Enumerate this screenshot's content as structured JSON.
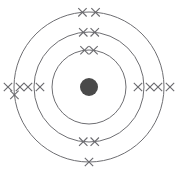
{
  "diagram": {
    "type": "bohr-atomic-model",
    "canvas": {
      "width": 178,
      "height": 173,
      "background": "#ffffff"
    },
    "center": {
      "x": 89,
      "y": 87
    },
    "colors": {
      "ring_stroke": "#6e6e72",
      "electron_stroke": "#6a6a6e",
      "nucleus_fill": "#4a4a4a",
      "background": "#ffffff"
    },
    "nucleus": {
      "label": "nucleus",
      "radius": 9,
      "fill": "#4a4a4a"
    },
    "electron_symbol": "x",
    "shells": [
      {
        "name": "K",
        "index": 1,
        "radius": 37,
        "electron_count": 2,
        "stroke_width": 1,
        "electrons": [
          {
            "angle_deg": -97,
            "offset": 0
          },
          {
            "angle_deg": -83,
            "offset": 0
          }
        ]
      },
      {
        "name": "L",
        "index": 2,
        "radius": 55,
        "electron_count": 8,
        "stroke_width": 1,
        "electrons": [
          {
            "angle_deg": -96,
            "offset": 0
          },
          {
            "angle_deg": -84,
            "offset": 0
          },
          {
            "angle_deg": 180,
            "offset": -6
          },
          {
            "angle_deg": 180,
            "offset": 6
          },
          {
            "angle_deg": 0,
            "offset": -6
          },
          {
            "angle_deg": 0,
            "offset": 6
          },
          {
            "angle_deg": 96,
            "offset": 0
          },
          {
            "angle_deg": 84,
            "offset": 0
          }
        ]
      },
      {
        "name": "M",
        "index": 3,
        "radius": 75,
        "electron_count": 8,
        "stroke_width": 1,
        "electrons": [
          {
            "angle_deg": -95,
            "offset": 0
          },
          {
            "angle_deg": -85,
            "offset": 0
          },
          {
            "angle_deg": 180,
            "offset": -6
          },
          {
            "angle_deg": 180,
            "offset": 6
          },
          {
            "angle_deg": 0,
            "offset": -6
          },
          {
            "angle_deg": 0,
            "offset": 6
          },
          {
            "angle_deg": 90,
            "offset": 0
          },
          {
            "angle_deg": 174,
            "offset": 0
          }
        ]
      }
    ],
    "electron_mark": {
      "arm_length": 4.2,
      "stroke_width": 1.1
    }
  }
}
